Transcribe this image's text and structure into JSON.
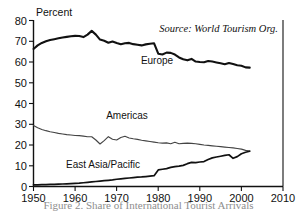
{
  "chart_data": {
    "type": "line",
    "title": "",
    "xlabel": "",
    "ylabel": "Percent",
    "xlim": [
      1950,
      2010
    ],
    "ylim": [
      0,
      80
    ],
    "xticks": [
      1950,
      1960,
      1970,
      1980,
      1990,
      2000,
      2010
    ],
    "yticks": [
      0,
      10,
      20,
      30,
      40,
      50,
      60,
      70,
      80
    ],
    "grid": false,
    "legend_position": "inline-labels",
    "annotations": [
      {
        "name": "source",
        "text": "Source: World Tourism Org."
      }
    ],
    "series": [
      {
        "name": "Europe",
        "x": [
          1950,
          1951,
          1952,
          1953,
          1954,
          1955,
          1956,
          1957,
          1958,
          1959,
          1960,
          1961,
          1962,
          1963,
          1964,
          1965,
          1966,
          1967,
          1968,
          1969,
          1970,
          1971,
          1972,
          1973,
          1974,
          1975,
          1976,
          1977,
          1978,
          1979,
          1980,
          1981,
          1982,
          1983,
          1984,
          1985,
          1986,
          1987,
          1988,
          1989,
          1990,
          1991,
          1992,
          1993,
          1994,
          1995,
          1996,
          1997,
          1998,
          1999,
          2000,
          2001,
          2002
        ],
        "values": [
          66.3,
          68.0,
          69.2,
          70.0,
          70.6,
          71.0,
          71.4,
          71.8,
          72.1,
          72.4,
          72.6,
          72.5,
          72.0,
          73.2,
          75.0,
          73.2,
          70.8,
          70.2,
          69.3,
          69.9,
          69.2,
          68.6,
          69.0,
          69.2,
          68.6,
          68.3,
          68.0,
          68.5,
          68.8,
          69.0,
          64.0,
          63.6,
          64.5,
          64.4,
          63.6,
          62.2,
          61.3,
          60.8,
          61.5,
          60.2,
          60.0,
          59.9,
          60.5,
          60.2,
          59.8,
          59.4,
          58.9,
          59.5,
          59.0,
          58.4,
          58.2,
          57.4,
          57.3
        ]
      },
      {
        "name": "Americas",
        "x": [
          1950,
          1951,
          1952,
          1953,
          1954,
          1955,
          1956,
          1957,
          1958,
          1959,
          1960,
          1961,
          1962,
          1963,
          1964,
          1965,
          1966,
          1967,
          1968,
          1969,
          1970,
          1971,
          1972,
          1973,
          1974,
          1975,
          1976,
          1977,
          1978,
          1979,
          1980,
          1981,
          1982,
          1983,
          1984,
          1985,
          1986,
          1987,
          1988,
          1989,
          1990,
          1991,
          1992,
          1993,
          1994,
          1995,
          1996,
          1997,
          1998,
          1999,
          2000,
          2001,
          2002
        ],
        "values": [
          29.4,
          28.3,
          27.5,
          26.9,
          26.4,
          26.0,
          25.6,
          25.3,
          25.0,
          24.8,
          24.6,
          24.5,
          24.3,
          24.0,
          24.0,
          22.4,
          20.5,
          22.1,
          24.0,
          22.8,
          22.4,
          23.6,
          24.2,
          23.4,
          23.0,
          22.7,
          22.3,
          22.0,
          21.7,
          21.4,
          21.1,
          20.9,
          21.0,
          20.6,
          21.3,
          20.6,
          20.8,
          20.9,
          20.8,
          20.6,
          20.3,
          20.0,
          19.8,
          19.6,
          19.4,
          19.2,
          19.0,
          18.8,
          18.6,
          18.3,
          18.0,
          17.4,
          17.1
        ]
      },
      {
        "name": "East Asia/Pacific",
        "x": [
          1950,
          1951,
          1952,
          1953,
          1954,
          1955,
          1956,
          1957,
          1958,
          1959,
          1960,
          1961,
          1962,
          1963,
          1964,
          1965,
          1966,
          1967,
          1968,
          1969,
          1970,
          1971,
          1972,
          1973,
          1974,
          1975,
          1976,
          1977,
          1978,
          1979,
          1980,
          1981,
          1982,
          1983,
          1984,
          1985,
          1986,
          1987,
          1988,
          1989,
          1990,
          1991,
          1992,
          1993,
          1994,
          1995,
          1996,
          1997,
          1998,
          1999,
          2000,
          2001,
          2002
        ],
        "values": [
          0.8,
          0.8,
          0.9,
          0.9,
          1.0,
          1.0,
          1.1,
          1.2,
          1.3,
          1.4,
          1.5,
          1.6,
          1.8,
          2.0,
          2.2,
          2.4,
          2.6,
          2.8,
          3.0,
          3.2,
          3.5,
          3.7,
          3.9,
          4.1,
          4.3,
          4.5,
          4.6,
          4.8,
          5.0,
          5.2,
          8.0,
          8.3,
          8.6,
          9.2,
          9.6,
          9.8,
          10.2,
          11.0,
          11.6,
          11.5,
          11.8,
          12.0,
          13.0,
          13.8,
          14.2,
          14.6,
          15.0,
          15.3,
          13.6,
          14.4,
          15.8,
          16.5,
          17.0
        ]
      }
    ]
  },
  "axis": {
    "y_title": "Percent",
    "y_ticks": [
      "80",
      "70",
      "60",
      "50",
      "40",
      "30",
      "20",
      "10",
      "0"
    ],
    "x_ticks": [
      "1950",
      "1960",
      "1970",
      "1980",
      "1990",
      "2000",
      "2010"
    ]
  },
  "labels": {
    "europe": "Europe",
    "americas": "Americas",
    "east_asia": "East Asia/Pacific",
    "source": "Source: World Tourism Org."
  },
  "caption": {
    "text": "Figure 2. Share of International Tourist Arrivals"
  }
}
